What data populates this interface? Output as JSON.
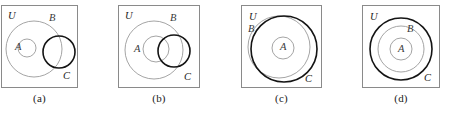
{
  "figure": {
    "kind": "venn-diagram-strip",
    "panel_count": 4,
    "colors": {
      "box_border": "#8a8a8a",
      "light_circle": "#9a9a9a",
      "bold_circle": "#141414",
      "background": "#ffffff",
      "label_text": "#3a3a3a",
      "caption_text": "#1a1a1a"
    },
    "panels": [
      {
        "id": "a",
        "caption": "(a)",
        "box": {
          "x": 1,
          "y": 5,
          "width": 77,
          "height": 83
        },
        "labels": {
          "universe": "U",
          "set_b": "B",
          "set_a": "A",
          "set_c": "C"
        },
        "label_positions": {
          "universe": {
            "x": 7,
            "y": 14
          },
          "set_b": {
            "x": 48,
            "y": 16
          },
          "set_a": {
            "x": 14,
            "y": 45
          },
          "set_c": {
            "x": 62,
            "y": 74
          }
        },
        "circles": [
          {
            "name": "B",
            "cx": 33,
            "cy": 44,
            "r": 28,
            "weight": "light"
          },
          {
            "name": "A",
            "cx": 26,
            "cy": 43,
            "r": 9,
            "weight": "light"
          },
          {
            "name": "C",
            "cx": 58,
            "cy": 47,
            "r": 16,
            "weight": "bold"
          }
        ],
        "relation": "A inside B; C overlaps B; A and C disjoint"
      },
      {
        "id": "b",
        "caption": "(b)",
        "box": {
          "x": 118,
          "y": 5,
          "width": 82,
          "height": 83
        },
        "labels": {
          "universe": "U",
          "set_b": "B",
          "set_a": "A",
          "set_c": "C"
        },
        "label_positions": {
          "universe": {
            "x": 7,
            "y": 14
          },
          "set_b": {
            "x": 52,
            "y": 16
          },
          "set_a": {
            "x": 16,
            "y": 47
          },
          "set_c": {
            "x": 66,
            "y": 75
          }
        },
        "circles": [
          {
            "name": "B",
            "cx": 36,
            "cy": 45,
            "r": 29,
            "weight": "light"
          },
          {
            "name": "A",
            "cx": 38,
            "cy": 44,
            "r": 13,
            "weight": "light"
          },
          {
            "name": "C",
            "cx": 56,
            "cy": 46,
            "r": 16,
            "weight": "bold"
          }
        ],
        "relation": "A inside B; C overlaps both A and B"
      },
      {
        "id": "c",
        "caption": "(c)",
        "box": {
          "x": 241,
          "y": 5,
          "width": 81,
          "height": 83
        },
        "labels": {
          "universe": "U",
          "set_b": "B",
          "set_a": "A",
          "set_c": "C"
        },
        "label_positions": {
          "universe": {
            "x": 8,
            "y": 15
          },
          "set_b": {
            "x": 7,
            "y": 27
          },
          "set_a": {
            "x": 39,
            "y": 45
          },
          "set_c": {
            "x": 64,
            "y": 77
          }
        },
        "circles": [
          {
            "name": "B",
            "cx": 38,
            "cy": 42,
            "r": 31,
            "weight": "light"
          },
          {
            "name": "C",
            "cx": 43,
            "cy": 44,
            "r": 33,
            "weight": "bold"
          },
          {
            "name": "A",
            "cx": 42,
            "cy": 43,
            "r": 11,
            "weight": "light"
          }
        ],
        "relation": "A inside both B and C; B and C overlap heavily"
      },
      {
        "id": "d",
        "caption": "(d)",
        "box": {
          "x": 362,
          "y": 5,
          "width": 78,
          "height": 83
        },
        "labels": {
          "universe": "U",
          "set_b": "B",
          "set_a": "A",
          "set_c": "C"
        },
        "label_positions": {
          "universe": {
            "x": 8,
            "y": 15
          },
          "set_b": {
            "x": 45,
            "y": 27
          },
          "set_a": {
            "x": 36,
            "y": 47
          },
          "set_c": {
            "x": 62,
            "y": 76
          }
        },
        "circles": [
          {
            "name": "C",
            "cx": 39,
            "cy": 44,
            "r": 31,
            "weight": "bold"
          },
          {
            "name": "B",
            "cx": 39,
            "cy": 44,
            "r": 23,
            "weight": "light"
          },
          {
            "name": "A",
            "cx": 39,
            "cy": 44,
            "r": 11,
            "weight": "light"
          }
        ],
        "relation": "concentric: A inside B inside C"
      }
    ]
  }
}
